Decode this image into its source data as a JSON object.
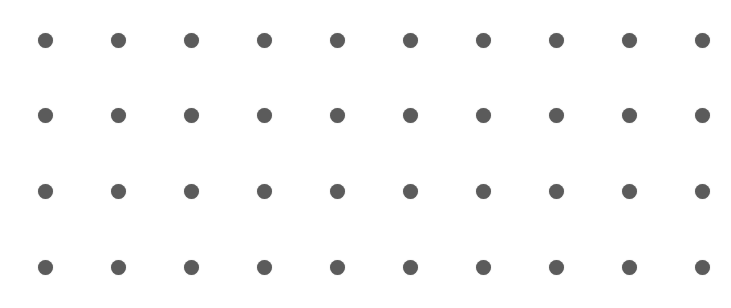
{
  "grid": {
    "rows": 4,
    "cols": 10,
    "origin_x": 45,
    "origin_y": 40,
    "spacing_x": 73,
    "spacing_y": 75.7,
    "dot_diameter": 15,
    "dot_color": "#5b5b5b",
    "background": "#ffffff"
  }
}
